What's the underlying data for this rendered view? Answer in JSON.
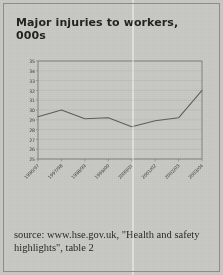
{
  "page": {
    "background_color": "#c9c9c6",
    "border_color": "#8d8d8a"
  },
  "title": "Major injuries to workers, 000s",
  "caption": "source: www.hse.gov.uk, \"Health and safety highlights\", table 2",
  "chart_data": {
    "type": "line",
    "title": "Major injuries to workers, 000s",
    "xlabel": "",
    "ylabel": "",
    "categories": [
      "1996/97",
      "1997/98",
      "1998/99",
      "1999/00",
      "2000/01",
      "2001/02",
      "2002/03",
      "2003/04"
    ],
    "values": [
      29.3,
      30.0,
      29.1,
      29.2,
      28.3,
      28.9,
      29.2,
      32.0
    ],
    "series": [
      {
        "name": "Major injuries to workers",
        "values": [
          29.3,
          30.0,
          29.1,
          29.2,
          28.3,
          28.9,
          29.2,
          32.0
        ]
      }
    ],
    "ylim": [
      25,
      35
    ],
    "ytick_step": 1,
    "yticks": [
      25,
      26,
      27,
      28,
      29,
      30,
      31,
      32,
      33,
      34,
      35
    ],
    "ytick_labels": [
      "25",
      "26",
      "27",
      "28",
      "29",
      "30",
      "31",
      "32",
      "33",
      "34",
      "35"
    ],
    "grid": true,
    "grid_axis": "y",
    "legend": false,
    "legend_position": "none",
    "line_color": "#5e5e58",
    "grid_color": "#b3b3ae",
    "axis_color": "#7c7c76",
    "tick_label_rotation": -45,
    "units": "thousands"
  }
}
